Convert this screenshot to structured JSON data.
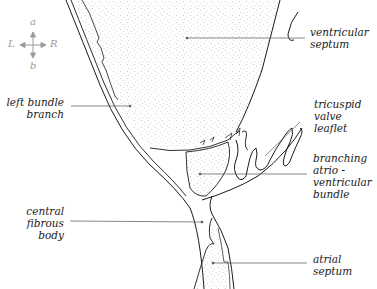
{
  "figure": {
    "type": "anatomical-line-drawing",
    "colors": {
      "line": "#1a1a1a",
      "leader": "#555555",
      "stipple": "#8a8a8a",
      "compass": "#9a9a9a",
      "background": "#ffffff"
    }
  },
  "compass": {
    "up": "a",
    "down": "b",
    "left": "L",
    "right": "R"
  },
  "labels": {
    "ventricular_septum": "ventricular\nseptum",
    "left_bundle_branch": "left bundle\nbranch",
    "tricuspid_valve_leaflet": "tricuspid\nvalve\nleaflet",
    "branching_av_bundle": "branching\natrio -\nventricular\nbundle",
    "central_fibrous_body": "central\nfibrous\nbody",
    "atrial_septum": "atrial\nseptum"
  }
}
